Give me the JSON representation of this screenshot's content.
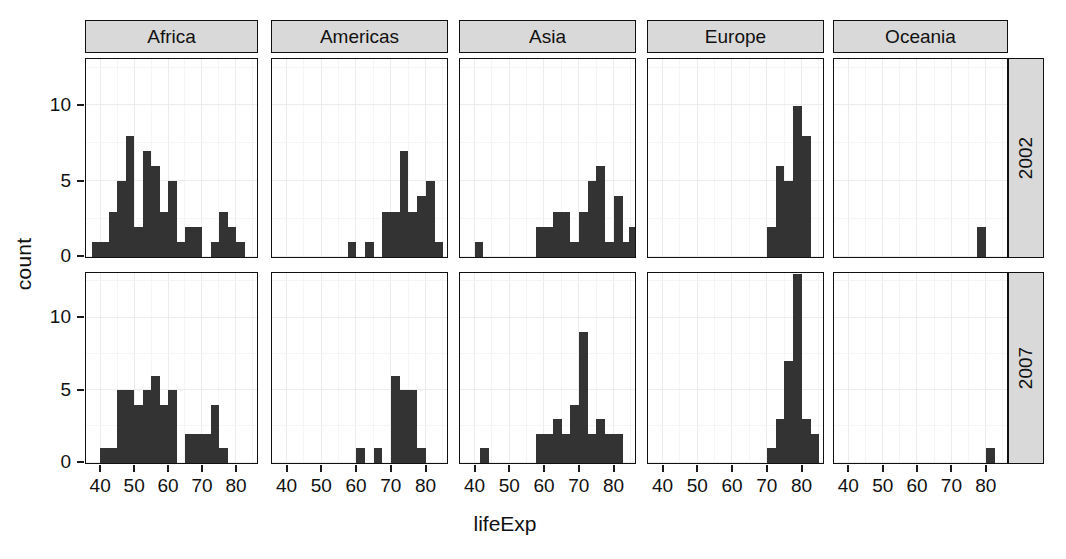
{
  "chart_data": {
    "type": "bar",
    "subtype": "faceted-histogram",
    "title": "",
    "xlabel": "lifeExp",
    "ylabel": "count",
    "xlim": [
      36,
      86
    ],
    "ylim": [
      0,
      13
    ],
    "xticks": [
      40,
      50,
      60,
      70,
      80
    ],
    "yticks": [
      0,
      5,
      10
    ],
    "grid": true,
    "legend": "none",
    "bin_width": 2.5,
    "bar_color": "#333333",
    "strip_color": "#d9d9d9",
    "panel_background": "#ffffff",
    "gridline_color": "#ececec",
    "facet_columns": [
      "Africa",
      "Americas",
      "Asia",
      "Europe",
      "Oceania"
    ],
    "facet_rows": [
      "2002",
      "2007"
    ],
    "panels": [
      {
        "continent": "Africa",
        "year": "2002",
        "bins": [
          {
            "x": 39.0,
            "count": 1
          },
          {
            "x": 41.5,
            "count": 1
          },
          {
            "x": 44.0,
            "count": 3
          },
          {
            "x": 46.5,
            "count": 5
          },
          {
            "x": 49.0,
            "count": 8
          },
          {
            "x": 51.5,
            "count": 2
          },
          {
            "x": 54.0,
            "count": 7
          },
          {
            "x": 56.5,
            "count": 6
          },
          {
            "x": 59.0,
            "count": 3
          },
          {
            "x": 61.5,
            "count": 5
          },
          {
            "x": 64.0,
            "count": 1
          },
          {
            "x": 66.5,
            "count": 2
          },
          {
            "x": 69.0,
            "count": 2
          },
          {
            "x": 71.5,
            "count": 0
          },
          {
            "x": 74.0,
            "count": 1
          },
          {
            "x": 76.5,
            "count": 3
          },
          {
            "x": 79.0,
            "count": 2
          },
          {
            "x": 81.5,
            "count": 1
          }
        ]
      },
      {
        "continent": "Americas",
        "year": "2002",
        "bins": [
          {
            "x": 59.0,
            "count": 1
          },
          {
            "x": 64.0,
            "count": 1
          },
          {
            "x": 69.0,
            "count": 3
          },
          {
            "x": 71.5,
            "count": 3
          },
          {
            "x": 74.0,
            "count": 7
          },
          {
            "x": 76.5,
            "count": 3
          },
          {
            "x": 79.0,
            "count": 4
          },
          {
            "x": 81.5,
            "count": 5
          },
          {
            "x": 84.0,
            "count": 1
          }
        ]
      },
      {
        "continent": "Asia",
        "year": "2002",
        "bins": [
          {
            "x": 41.5,
            "count": 1
          },
          {
            "x": 59.0,
            "count": 2
          },
          {
            "x": 61.5,
            "count": 2
          },
          {
            "x": 64.0,
            "count": 3
          },
          {
            "x": 66.5,
            "count": 3
          },
          {
            "x": 69.0,
            "count": 1
          },
          {
            "x": 71.5,
            "count": 3
          },
          {
            "x": 74.0,
            "count": 5
          },
          {
            "x": 76.5,
            "count": 6
          },
          {
            "x": 79.0,
            "count": 1
          },
          {
            "x": 81.5,
            "count": 4
          },
          {
            "x": 84.0,
            "count": 1
          },
          {
            "x": 86.0,
            "count": 2
          }
        ]
      },
      {
        "continent": "Europe",
        "year": "2002",
        "bins": [
          {
            "x": 71.5,
            "count": 2
          },
          {
            "x": 74.0,
            "count": 6
          },
          {
            "x": 76.5,
            "count": 5
          },
          {
            "x": 79.0,
            "count": 10
          },
          {
            "x": 81.5,
            "count": 8
          }
        ]
      },
      {
        "continent": "Oceania",
        "year": "2002",
        "bins": [
          {
            "x": 79.0,
            "count": 2
          }
        ]
      },
      {
        "continent": "Africa",
        "year": "2007",
        "bins": [
          {
            "x": 41.5,
            "count": 1
          },
          {
            "x": 44.0,
            "count": 1
          },
          {
            "x": 46.5,
            "count": 5
          },
          {
            "x": 49.0,
            "count": 5
          },
          {
            "x": 51.5,
            "count": 4
          },
          {
            "x": 54.0,
            "count": 5
          },
          {
            "x": 56.5,
            "count": 6
          },
          {
            "x": 59.0,
            "count": 4
          },
          {
            "x": 61.5,
            "count": 5
          },
          {
            "x": 64.0,
            "count": 0
          },
          {
            "x": 66.5,
            "count": 2
          },
          {
            "x": 69.0,
            "count": 2
          },
          {
            "x": 71.5,
            "count": 2
          },
          {
            "x": 74.0,
            "count": 4
          },
          {
            "x": 76.5,
            "count": 1
          }
        ]
      },
      {
        "continent": "Americas",
        "year": "2007",
        "bins": [
          {
            "x": 61.5,
            "count": 1
          },
          {
            "x": 66.5,
            "count": 1
          },
          {
            "x": 71.5,
            "count": 6
          },
          {
            "x": 74.0,
            "count": 5
          },
          {
            "x": 76.5,
            "count": 5
          },
          {
            "x": 79.0,
            "count": 1
          }
        ]
      },
      {
        "continent": "Asia",
        "year": "2007",
        "bins": [
          {
            "x": 43.0,
            "count": 1
          },
          {
            "x": 59.0,
            "count": 2
          },
          {
            "x": 61.5,
            "count": 2
          },
          {
            "x": 64.0,
            "count": 3
          },
          {
            "x": 66.5,
            "count": 2
          },
          {
            "x": 69.0,
            "count": 4
          },
          {
            "x": 71.5,
            "count": 9
          },
          {
            "x": 74.0,
            "count": 2
          },
          {
            "x": 76.5,
            "count": 3
          },
          {
            "x": 79.0,
            "count": 2
          },
          {
            "x": 81.5,
            "count": 2
          }
        ]
      },
      {
        "continent": "Europe",
        "year": "2007",
        "bins": [
          {
            "x": 71.5,
            "count": 1
          },
          {
            "x": 74.0,
            "count": 3
          },
          {
            "x": 76.5,
            "count": 7
          },
          {
            "x": 79.0,
            "count": 13
          },
          {
            "x": 81.5,
            "count": 3
          },
          {
            "x": 84.0,
            "count": 2
          }
        ]
      },
      {
        "continent": "Oceania",
        "year": "2007",
        "bins": [
          {
            "x": 81.5,
            "count": 1
          }
        ]
      }
    ]
  },
  "axes": {
    "x_title": "lifeExp",
    "y_title": "count",
    "x_tick_labels": [
      "40",
      "50",
      "60",
      "70",
      "80"
    ],
    "y_tick_labels": [
      "0",
      "5",
      "10"
    ]
  },
  "strips": {
    "columns": [
      "Africa",
      "Americas",
      "Asia",
      "Europe",
      "Oceania"
    ],
    "rows": [
      "2002",
      "2007"
    ]
  }
}
